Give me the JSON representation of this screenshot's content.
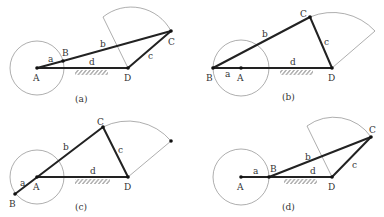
{
  "figure": {
    "panels": [
      {
        "caption": "(a)",
        "joints": {
          "A": [
            37,
            68
          ],
          "B": [
            63,
            61
          ],
          "C": [
            171,
            31
          ],
          "D": [
            128,
            68
          ]
        },
        "labels": {
          "A": "A",
          "B": "B",
          "C": "C",
          "D": "D",
          "a": "a",
          "b": "b",
          "c": "c",
          "d": "d"
        }
      },
      {
        "caption": "(b)",
        "joints": {
          "A": [
            241,
            68
          ],
          "B": [
            213,
            68
          ],
          "C": [
            310,
            17
          ],
          "D": [
            332,
            68
          ]
        },
        "labels": {
          "A": "A",
          "B": "B",
          "C": "C",
          "D": "D",
          "a": "a",
          "b": "b",
          "c": "c",
          "d": "d"
        }
      },
      {
        "caption": "(c)",
        "joints": {
          "A": [
            37,
            177
          ],
          "B": [
            15,
            194
          ],
          "C": [
            103,
            127
          ],
          "D": [
            128,
            177
          ]
        },
        "labels": {
          "A": "A",
          "B": "B",
          "C": "C",
          "D": "D",
          "a": "a",
          "b": "b",
          "c": "c",
          "d": "d"
        }
      },
      {
        "caption": "(d)",
        "joints": {
          "A": [
            241,
            177
          ],
          "B": [
            269,
            177
          ],
          "C": [
            371,
            137
          ],
          "D": [
            332,
            177
          ]
        },
        "labels": {
          "A": "A",
          "B": "B",
          "C": "C",
          "D": "D",
          "a": "a",
          "b": "b",
          "c": "c",
          "d": "d"
        }
      }
    ]
  }
}
